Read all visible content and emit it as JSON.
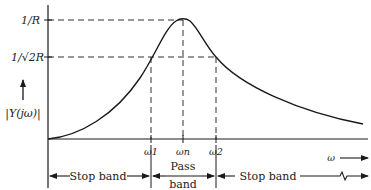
{
  "diagram": {
    "y_axis_label": "|Y(jω)|",
    "x_axis_label": "ω",
    "y_levels": {
      "peak_label": "1/R",
      "half_power_label": "1/√2R"
    },
    "x_marks": {
      "w1": "ω1",
      "wn": "ωn",
      "w2": "ω2"
    },
    "bands": {
      "left": "Stop band",
      "middle_top": "Pass",
      "middle_bottom": "band",
      "right": "Stop band"
    },
    "colors": {
      "ink": "#1a1a1a",
      "background": "#ffffff"
    }
  }
}
